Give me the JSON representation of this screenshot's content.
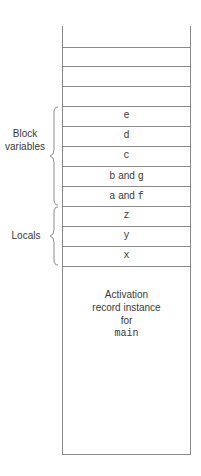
{
  "diagram": {
    "type": "stack-layout",
    "empty_top_slots": 4,
    "cells": [
      {
        "label": "e",
        "mono": true
      },
      {
        "label": "d",
        "mono": true
      },
      {
        "label": "c",
        "mono": true
      },
      {
        "label": "b and g",
        "mono": false,
        "parts": [
          "b",
          " and ",
          "g"
        ]
      },
      {
        "label": "a and f",
        "mono": false,
        "parts": [
          "a",
          " and ",
          "f"
        ]
      },
      {
        "label": "z",
        "mono": true
      },
      {
        "label": "y",
        "mono": true
      },
      {
        "label": "x",
        "mono": true
      }
    ],
    "activation_record": {
      "line1": "Activation",
      "line2": "record instance",
      "line3": "for",
      "line4": "main"
    },
    "groups": [
      {
        "name": "block-variables",
        "line1": "Block",
        "line2": "variables",
        "spans": [
          "e",
          "d",
          "c",
          "b and g",
          "a and f"
        ]
      },
      {
        "name": "locals",
        "line1": "Locals",
        "spans": [
          "z",
          "y",
          "x"
        ]
      }
    ],
    "colors": {
      "line": "#8a8a8a",
      "text": "#3a3a3a",
      "background": "#ffffff"
    }
  }
}
